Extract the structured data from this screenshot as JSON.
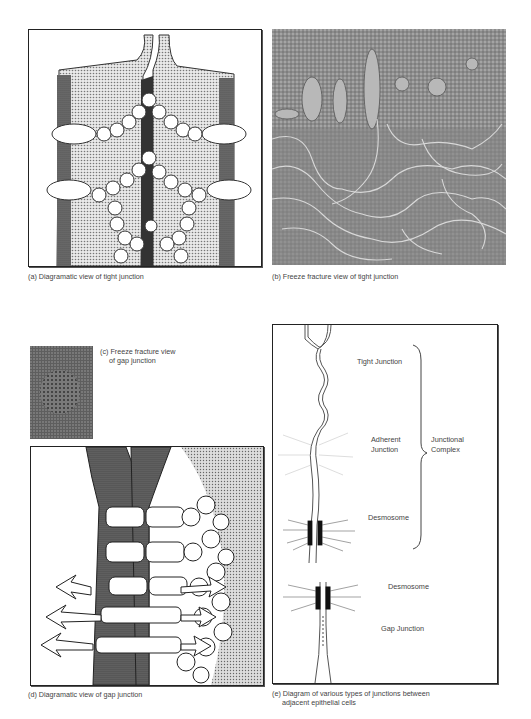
{
  "figure": {
    "panels": [
      {
        "id": "a",
        "caption": "(a) Diagramatic view of tight junction"
      },
      {
        "id": "b",
        "caption": "(b) Freeze  fracture view of tight junction"
      },
      {
        "id": "c",
        "caption_line1": "(c) Freeze  fracture view",
        "caption_line2": "of gap junction"
      },
      {
        "id": "d",
        "caption": "(d) Diagramatic view of gap junction"
      },
      {
        "id": "e",
        "caption_line1": "(e) Diagram of various types of junctions between",
        "caption_line2": "adjacent epithelial cells",
        "labels": {
          "tight_junction": "Tight Junction",
          "adherent_1": "Adherent",
          "adherent_2": "Junction",
          "desmosome_1": "Desmosome",
          "junctional_1": "Junctional",
          "junctional_2": "Complex",
          "desmosome_2": "Desmosome",
          "gap_junction": "Gap Junction"
        }
      }
    ]
  }
}
